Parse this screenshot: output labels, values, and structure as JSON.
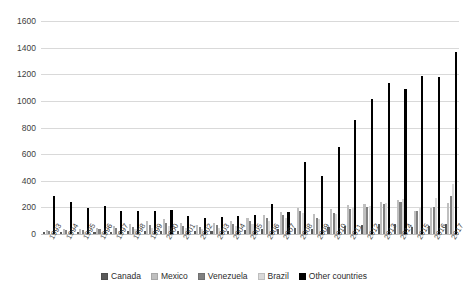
{
  "chart_data": {
    "type": "bar",
    "title": "",
    "subtitle": "",
    "xlabel": "",
    "ylabel": "",
    "ylim": [
      0,
      1600
    ],
    "ytick_step": 200,
    "yticks": [
      0,
      200,
      400,
      600,
      800,
      1000,
      1200,
      1400,
      1600
    ],
    "ytick_labels": [
      "0",
      "200",
      "400",
      "600",
      "800",
      "1000",
      "1200",
      "1400",
      "1600"
    ],
    "grid": true,
    "grid_axis": "y",
    "legend_position": "bottom-center",
    "orientation": "vertical",
    "grouping": "clustered",
    "categories": [
      "1993",
      "1994",
      "1995",
      "1996",
      "1997",
      "1998",
      "1999",
      "2000",
      "2001",
      "2002",
      "2003",
      "2004",
      "2005",
      "2006",
      "2007",
      "2008",
      "2009",
      "2010",
      "2011",
      "2012",
      "2013",
      "2014",
      "2015",
      "2016",
      "2017"
    ],
    "series": [
      {
        "name": "Canada",
        "color": "#595959",
        "values": [
          14,
          16,
          13,
          15,
          18,
          20,
          22,
          24,
          21,
          19,
          22,
          26,
          30,
          34,
          40,
          46,
          38,
          52,
          60,
          66,
          72,
          78,
          52,
          60,
          74
        ]
      },
      {
        "name": "Mexico",
        "color": "#bfbfbf",
        "values": [
          30,
          34,
          36,
          48,
          60,
          74,
          96,
          116,
          84,
          70,
          82,
          96,
          118,
          140,
          166,
          196,
          150,
          186,
          218,
          226,
          238,
          252,
          176,
          196,
          236
        ]
      },
      {
        "name": "Venezuela",
        "color": "#808080",
        "values": [
          26,
          28,
          30,
          36,
          44,
          52,
          66,
          80,
          62,
          54,
          64,
          78,
          96,
          118,
          142,
          170,
          124,
          158,
          190,
          206,
          222,
          238,
          170,
          200,
          288
        ]
      },
      {
        "name": "Brazil",
        "color": "#d9d9d9",
        "values": [
          10,
          12,
          14,
          18,
          24,
          34,
          48,
          62,
          44,
          36,
          46,
          58,
          76,
          98,
          124,
          156,
          116,
          152,
          192,
          214,
          236,
          262,
          204,
          268,
          372
        ]
      },
      {
        "name": "Other countries",
        "color": "#000000",
        "values": [
          284,
          240,
          196,
          212,
          172,
          176,
          172,
          184,
          132,
          124,
          126,
          132,
          146,
          228,
          162,
          544,
          438,
          652,
          860,
          1014,
          1134,
          1088,
          1190,
          1178,
          1368
        ]
      }
    ]
  },
  "legend": {
    "items": [
      {
        "label": "Canada",
        "color": "#595959"
      },
      {
        "label": "Mexico",
        "color": "#bfbfbf"
      },
      {
        "label": "Venezuela",
        "color": "#808080"
      },
      {
        "label": "Brazil",
        "color": "#d9d9d9"
      },
      {
        "label": "Other countries",
        "color": "#000000"
      }
    ]
  },
  "style": {
    "background": "#ffffff",
    "gridline_color": "#d9d9d9",
    "axis_text_color": "#404040"
  }
}
